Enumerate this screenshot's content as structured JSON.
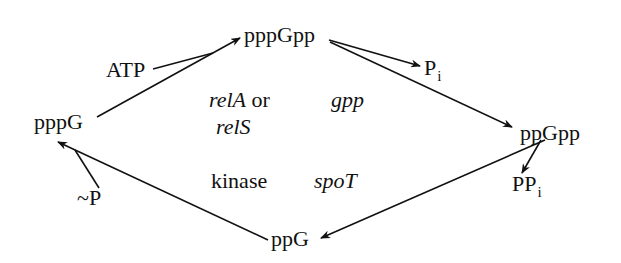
{
  "nodes": {
    "pppGpp": "pppGpp",
    "ppGpp": "ppGpp",
    "ppG": "ppG",
    "pppG": "pppG"
  },
  "side_products": {
    "atp": "ATP",
    "pi_main": "P",
    "pi_sub": "i",
    "ppi_main": "PP",
    "ppi_sub": "i",
    "tilde_p": "~P"
  },
  "enzymes": {
    "relA": "relA",
    "or": " or",
    "relS": "relS",
    "gpp": "gpp",
    "kinase": "kinase",
    "spoT": "spoT"
  },
  "colors": {
    "ink": "#111111",
    "background": "#ffffff"
  }
}
